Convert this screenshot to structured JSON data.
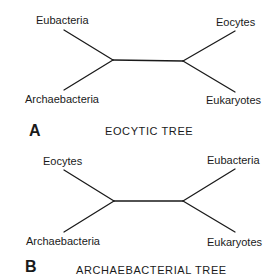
{
  "figure": {
    "panels": [
      {
        "letter": "A",
        "title": "EOCYTIC TREE",
        "leaves": {
          "top_left": "Eubacteria",
          "bottom_left": "Archaebacteria",
          "top_right": "Eocytes",
          "bottom_right": "Eukaryotes"
        }
      },
      {
        "letter": "B",
        "title": "ARCHAEBACTERIAL TREE",
        "leaves": {
          "top_left": "Eocytes",
          "bottom_left": "Archaebacteria",
          "top_right": "Eubacteria",
          "bottom_right": "Eukaryotes"
        }
      }
    ],
    "line_color": "#1a1a1a"
  }
}
